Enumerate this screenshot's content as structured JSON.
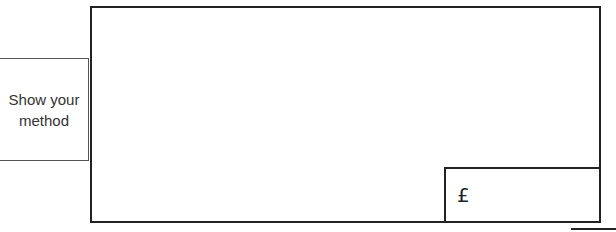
{
  "side_label": {
    "line1": "Show your",
    "line2": "method"
  },
  "answer": {
    "currency_symbol": "£",
    "value": ""
  }
}
